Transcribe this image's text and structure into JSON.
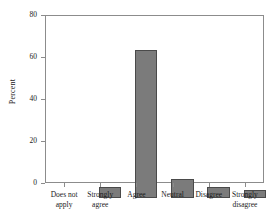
{
  "chart_data": {
    "type": "bar",
    "title": "",
    "xlabel": "",
    "ylabel": "Percent",
    "categories": [
      "Does not apply",
      "Strongly agree",
      "Agree",
      "Neutral",
      "Disagree",
      "Strongly disagree"
    ],
    "values": [
      5.5,
      71.5,
      9.3,
      5.5,
      3.8,
      5.5
    ],
    "ylim": [
      0,
      80
    ],
    "yticks": [
      0,
      20,
      40,
      60,
      80
    ],
    "ytick_labels": [
      "0",
      "20",
      "40",
      "60",
      "80"
    ],
    "grid": false,
    "legend": false,
    "series": [
      {
        "name": "Percent",
        "values": [
          5.5,
          71.5,
          9.3,
          5.5,
          3.8,
          5.5
        ]
      }
    ],
    "colors": {
      "bar_fill": "#7b7b7b",
      "bar_edge": "#4a4a4a",
      "axis": "#8c8c8c",
      "text": "#1a1a1a",
      "background": "#ffffff"
    }
  },
  "axes": {
    "y_title": "Percent",
    "y_tick_0": "0",
    "y_tick_1": "20",
    "y_tick_2": "40",
    "y_tick_3": "60",
    "y_tick_4": "80"
  },
  "x_labels": {
    "cat_0_line_1": "Does not",
    "cat_0_line_2": "apply",
    "cat_1_line_1": "Strongly",
    "cat_1_line_2": "agree",
    "cat_2_line_1": "Agree",
    "cat_2_line_2": "",
    "cat_3_line_1": "Neutral",
    "cat_3_line_2": "",
    "cat_4_line_1": "Disagree",
    "cat_4_line_2": "",
    "cat_5_line_1": "Strongly",
    "cat_5_line_2": "disagree"
  }
}
